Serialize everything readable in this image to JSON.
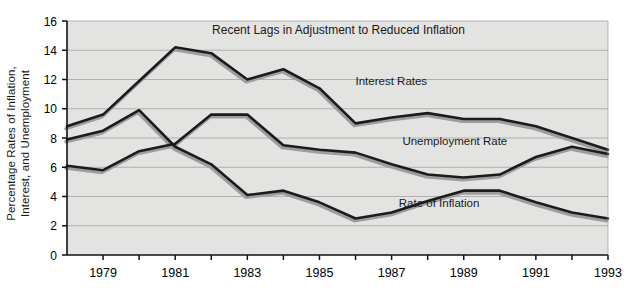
{
  "chart_data": {
    "type": "line",
    "title": "Recent Lags in Adjustment to Reduced Inflation",
    "xlabel": "",
    "ylabel": "Percentage Rates of Inflation,\nInterest, and Unemployment",
    "x": [
      1978,
      1979,
      1980,
      1981,
      1982,
      1983,
      1984,
      1985,
      1986,
      1987,
      1988,
      1989,
      1990,
      1991,
      1992,
      1993
    ],
    "xtick_labels": [
      "1979",
      "1981",
      "1983",
      "1985",
      "1987",
      "1989",
      "1991",
      "1993"
    ],
    "xticks": [
      1979,
      1981,
      1983,
      1985,
      1987,
      1989,
      1991,
      1993
    ],
    "xlim": [
      1978,
      1993
    ],
    "ytick_labels": [
      "0",
      "2",
      "4",
      "6",
      "8",
      "10",
      "12",
      "14",
      "16"
    ],
    "yticks": [
      0,
      2,
      4,
      6,
      8,
      10,
      12,
      14,
      16
    ],
    "ylim": [
      0,
      16
    ],
    "grid": true,
    "legend_position": "inline-annotations",
    "series": [
      {
        "name": "Interest Rates",
        "label_x": 1986.0,
        "label_y": 11.6,
        "values": [
          8.8,
          9.6,
          11.9,
          14.2,
          13.8,
          12.0,
          12.7,
          11.4,
          9.0,
          9.4,
          9.7,
          9.3,
          9.3,
          8.8,
          8.0,
          7.2
        ]
      },
      {
        "name": "Unemployment Rate",
        "label_x": 1987.3,
        "label_y": 7.5,
        "values": [
          6.1,
          5.8,
          7.1,
          7.6,
          9.6,
          9.6,
          7.5,
          7.2,
          7.0,
          6.2,
          5.5,
          5.3,
          5.5,
          6.7,
          7.4,
          6.9
        ]
      },
      {
        "name": "Rate of Inflation",
        "label_x": 1987.2,
        "label_y": 3.3,
        "values": [
          7.9,
          8.5,
          9.9,
          7.4,
          6.2,
          4.1,
          4.4,
          3.6,
          2.5,
          2.9,
          3.7,
          4.4,
          4.4,
          3.6,
          2.9,
          2.5
        ]
      }
    ]
  }
}
